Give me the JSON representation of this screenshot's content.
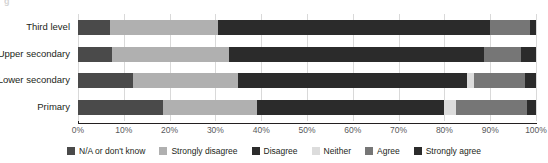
{
  "chart_data": {
    "type": "bar",
    "orientation": "horizontal",
    "stacked": true,
    "normalized": "percent",
    "title": "",
    "subtitle": "",
    "xlabel": "",
    "ylabel": "",
    "xlim": [
      0,
      100
    ],
    "xticks": [
      0,
      10,
      20,
      30,
      40,
      50,
      60,
      70,
      80,
      90,
      100
    ],
    "xticklabels": [
      "0%",
      "10%",
      "20%",
      "30%",
      "40%",
      "50%",
      "60%",
      "70%",
      "80%",
      "90%",
      "100%"
    ],
    "grid": true,
    "grid_axis": "x",
    "legend_position": "bottom",
    "categories": [
      "Third level",
      "Upper secondary",
      "Lower secondary",
      "Primary"
    ],
    "series": [
      {
        "name": "N/A or don't know",
        "color": "#4a4a4a",
        "values": [
          7.0,
          7.5,
          12.0,
          18.5
        ]
      },
      {
        "name": "Strongly disagree",
        "color": "#b0b0b0",
        "values": [
          23.5,
          25.5,
          23.0,
          20.5
        ]
      },
      {
        "name": "Disagree",
        "color": "#2b2b2b",
        "values": [
          59.5,
          55.6,
          50.0,
          41.0
        ]
      },
      {
        "name": "Neither",
        "color": "#dcdcdc",
        "values": [
          0.0,
          0.0,
          1.5,
          2.5
        ]
      },
      {
        "name": "Agree",
        "color": "#767676",
        "values": [
          8.7,
          8.1,
          11.0,
          15.5
        ]
      },
      {
        "name": "Strongly agree",
        "color": "#2b2b2b",
        "values": [
          1.3,
          3.3,
          2.5,
          2.0
        ]
      }
    ]
  },
  "legend": {
    "items": [
      {
        "label": "N/A or don't know",
        "color": "#4a4a4a"
      },
      {
        "label": "Strongly disagree",
        "color": "#b0b0b0"
      },
      {
        "label": "Disagree",
        "color": "#2b2b2b"
      },
      {
        "label": "Neither",
        "color": "#dcdcdc"
      },
      {
        "label": "Agree",
        "color": "#767676"
      },
      {
        "label": "Strongly agree",
        "color": "#2b2b2b"
      }
    ]
  },
  "axis": {
    "grid_color": "#d9d9d9",
    "axis_color": "#231f20",
    "tick_label_color": "#58595b"
  }
}
